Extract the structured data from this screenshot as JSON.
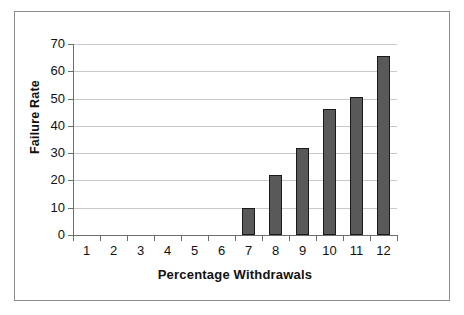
{
  "chart_data": {
    "type": "bar",
    "title": "",
    "subtitle": "",
    "xlabel": "Percentage Withdrawals",
    "ylabel": "Failure Rate",
    "categories": [
      "1",
      "2",
      "3",
      "4",
      "5",
      "6",
      "7",
      "8",
      "9",
      "10",
      "11",
      "12"
    ],
    "values": [
      0,
      0,
      0,
      0,
      0,
      0,
      10,
      22,
      32,
      46,
      50.5,
      65.5
    ],
    "series": [
      {
        "name": "Failure Rate",
        "values": [
          0,
          0,
          0,
          0,
          0,
          0,
          10,
          22,
          32,
          46,
          50.5,
          65.5
        ]
      }
    ],
    "ylim": [
      0,
      70
    ],
    "ytick_labels": [
      "0",
      "10",
      "20",
      "30",
      "40",
      "50",
      "60",
      "70"
    ],
    "ytick_values": [
      0,
      10,
      20,
      30,
      40,
      50,
      60,
      70
    ],
    "xtick_labels": [
      "1",
      "2",
      "3",
      "4",
      "5",
      "6",
      "7",
      "8",
      "9",
      "10",
      "11",
      "12"
    ],
    "grid": true,
    "grid_axis": "y",
    "legend": false,
    "legend_position": "none",
    "annotations": [],
    "colors": {
      "bar_fill": "#595959",
      "bar_outline": "#1a1a1a",
      "gridline": "#c9c9c9",
      "axis_line": "#6e6e6e",
      "plot_background": "#ffffff",
      "frame_border": "#8c8c8c",
      "text": "#111111"
    }
  },
  "figure": {
    "background": "#ffffff",
    "border_color": "#8c8c8c"
  }
}
